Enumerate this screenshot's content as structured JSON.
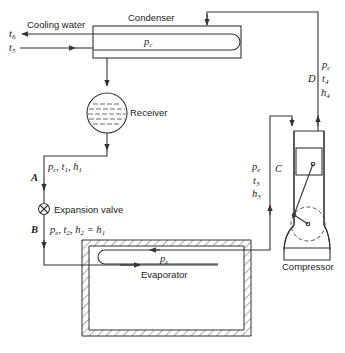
{
  "diagram": {
    "type": "vapor-compression refrigeration cycle schematic",
    "components": {
      "condenser": {
        "label": "Condenser",
        "pressure_label": "p",
        "pressure_sub": "c"
      },
      "cooling_water": {
        "label": "Cooling water",
        "outlet": {
          "t": "t",
          "sub": "6"
        },
        "inlet": {
          "t": "t",
          "sub": "5"
        }
      },
      "receiver": {
        "label": "Receiver"
      },
      "expansion_valve": {
        "label": "Expansion valve"
      },
      "evaporator": {
        "label": "Evaporator",
        "pressure_label": "p",
        "pressure_sub": "e"
      },
      "compressor": {
        "label": "Compressor"
      }
    },
    "states": {
      "A": {
        "letter": "A",
        "text_p": "p",
        "p_sub": "c",
        "text_t": "t",
        "t_sub": "1",
        "text_h": "h",
        "h_sub": "1"
      },
      "B": {
        "letter": "B",
        "text_p": "p",
        "p_sub": "e",
        "text_t": "t",
        "t_sub": "2",
        "text_h": "h",
        "h_sub": "2",
        "eq": "= h",
        "eq_sub": "1"
      },
      "C": {
        "letter": "C",
        "text_p": "p",
        "p_sub": "e",
        "text_t": "t",
        "t_sub": "3",
        "text_h": "h",
        "h_sub": "3"
      },
      "D": {
        "letter": "D",
        "text_p": "p",
        "p_sub": "c",
        "text_t": "t",
        "t_sub": "4",
        "text_h": "h",
        "h_sub": "4"
      }
    }
  }
}
